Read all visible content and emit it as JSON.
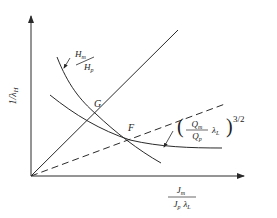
{
  "diagram": {
    "y_axis_label": "1/λ",
    "y_axis_label_sub": "H",
    "x_axis_label": {
      "numerator": "J",
      "numerator_sub": "m",
      "denominator": "J",
      "denominator_sub": "p",
      "denominator_extra": "λ",
      "denominator_extra_sub": "L"
    },
    "curve_1_label": {
      "numerator": "H",
      "numerator_sub": "m",
      "denominator": "H",
      "denominator_sub": "p"
    },
    "curve_2_label": {
      "open_paren": "(",
      "numerator": "Q",
      "numerator_sub": "m",
      "denominator": "Q",
      "denominator_sub": "p",
      "factor": "λ",
      "factor_sub": "L",
      "close_paren": ")",
      "exponent": "3/2"
    },
    "points": [
      {
        "label": "G"
      },
      {
        "label": "F"
      }
    ],
    "colors": {
      "line": "#2a2a2a",
      "background": "#ffffff"
    }
  }
}
